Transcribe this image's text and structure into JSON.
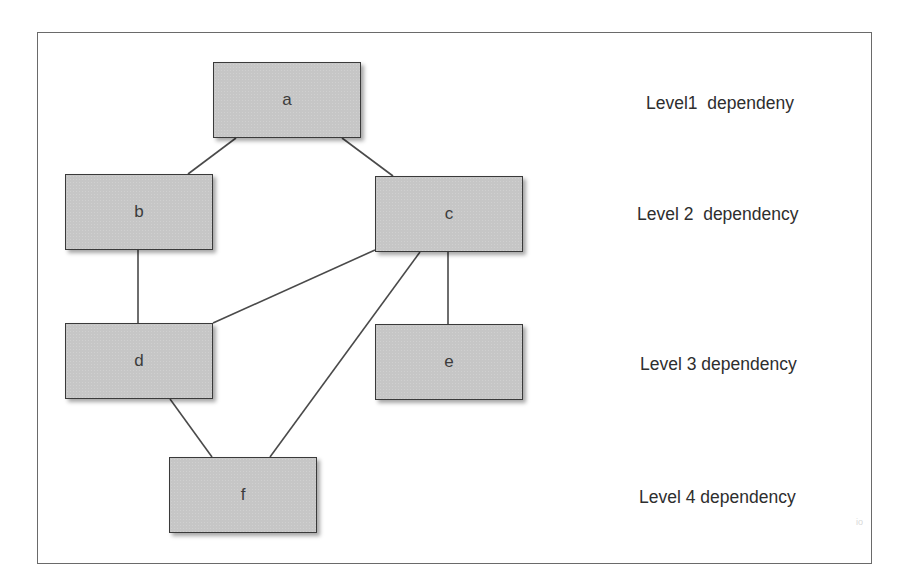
{
  "diagram": {
    "type": "dependency-graph",
    "nodes": [
      {
        "id": "a",
        "label": "a",
        "level": 1
      },
      {
        "id": "b",
        "label": "b",
        "level": 2
      },
      {
        "id": "c",
        "label": "c",
        "level": 2
      },
      {
        "id": "d",
        "label": "d",
        "level": 3
      },
      {
        "id": "e",
        "label": "e",
        "level": 3
      },
      {
        "id": "f",
        "label": "f",
        "level": 4
      }
    ],
    "edges": [
      [
        "a",
        "b"
      ],
      [
        "a",
        "c"
      ],
      [
        "b",
        "d"
      ],
      [
        "c",
        "d"
      ],
      [
        "c",
        "e"
      ],
      [
        "c",
        "f"
      ],
      [
        "d",
        "f"
      ]
    ],
    "levels": [
      "Level1  dependeny",
      "Level 2  dependency",
      "Level 3 dependency",
      "Level 4 dependency"
    ],
    "colors": {
      "node_fill": "#c6c6c6",
      "node_border": "#3a3a3a",
      "edge": "#4a4a4a",
      "frame": "#6a6a6a"
    },
    "watermark": "io"
  }
}
